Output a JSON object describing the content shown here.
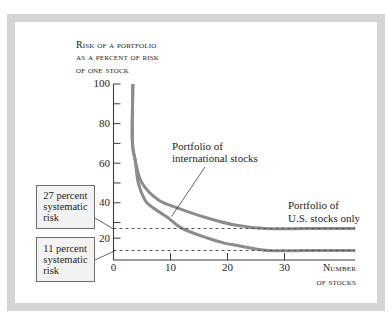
{
  "colors": {
    "frame": "#d5d5d5",
    "curve": "#8c8c8c",
    "axis": "#3c3c3c",
    "reference_line": "#555555",
    "box_fill": "#f2f2f2",
    "box_border": "#6e6e6e",
    "text": "#1e1e1e"
  },
  "chart_data": {
    "type": "line",
    "title": "",
    "ylabel": [
      "Risk of a portfolio",
      "as a percent of risk",
      "of one stock"
    ],
    "xlabel": [
      "Number",
      "of stocks"
    ],
    "xlim": [
      0,
      42.4
    ],
    "ylim": [
      0,
      100
    ],
    "grid": false,
    "legend": "none (direct labels with callout lines)",
    "x_axis": {
      "ticks": [
        10,
        20,
        30
      ],
      "labeled": [
        0,
        10,
        20,
        30
      ]
    },
    "y_axis": {
      "ticks": [
        20,
        30,
        40,
        50,
        60,
        70,
        80,
        90,
        100
      ],
      "labeled": [
        20,
        40,
        60,
        80,
        100
      ]
    },
    "series": [
      {
        "name": "Portfolio of U.S. stocks only",
        "label_lines": [
          "Portfolio of",
          "U.S. stocks only"
        ],
        "asymptote": 27,
        "points": [
          [
            3.4,
            100
          ],
          [
            3.3,
            71.7
          ],
          [
            3.8,
            61.6
          ],
          [
            5.0,
            50.0
          ],
          [
            7.9,
            41.4
          ],
          [
            11.4,
            37.2
          ],
          [
            16.6,
            32.2
          ],
          [
            21.3,
            28.8
          ],
          [
            26.6,
            27
          ],
          [
            34,
            27
          ],
          [
            42.4,
            27
          ]
        ]
      },
      {
        "name": "Portfolio of international stocks",
        "label_lines": [
          "Portfolio of",
          "international stocks"
        ],
        "asymptote": 11,
        "points": [
          [
            3.4,
            100
          ],
          [
            3.3,
            71.7
          ],
          [
            3.8,
            61.6
          ],
          [
            4.35,
            50.0
          ],
          [
            5.5,
            41.4
          ],
          [
            6.7,
            38.0
          ],
          [
            9.6,
            32.3
          ],
          [
            12.0,
            27.1
          ],
          [
            16.6,
            19.9
          ],
          [
            19.6,
            16.2
          ],
          [
            21.3,
            15.0
          ],
          [
            27.1,
            11
          ],
          [
            34,
            11
          ],
          [
            42.4,
            11
          ]
        ]
      }
    ],
    "reference_lines": [
      {
        "y": 27,
        "style": "dashed",
        "label_lines": [
          "27 percent",
          "systematic",
          "risk"
        ]
      },
      {
        "y": 11,
        "style": "dashed",
        "label_lines": [
          "11 percent",
          "systematic",
          "risk"
        ]
      }
    ]
  }
}
